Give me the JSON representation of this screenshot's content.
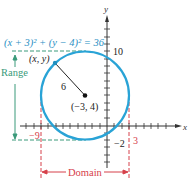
{
  "diagram": {
    "equation": "(x + 3)² + (y − 4)² = 36",
    "axes": {
      "x_label": "x",
      "y_label": "y"
    },
    "center_label": "(−3, 4)",
    "point_label": "(x, y)",
    "radius_label": "6",
    "ticks": {
      "y_top": "10",
      "x_left": "−9",
      "y_bottom": "−2",
      "x_right": "3"
    },
    "range_label": "Range",
    "domain_label": "Domain",
    "colors": {
      "circle": "#29a3d6",
      "equation": "#2b8fc4",
      "range": "#3a9a7a",
      "domain": "#d6404a",
      "axis": "#333333"
    }
  }
}
